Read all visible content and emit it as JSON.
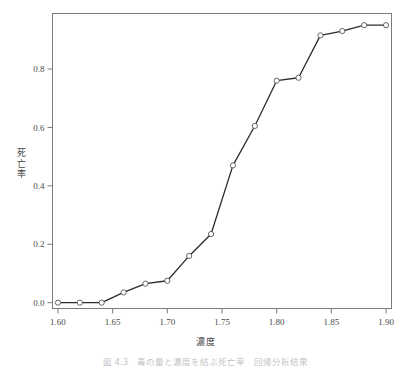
{
  "figure": {
    "caption": "図 4.3　毒の量と濃度を結ぶ死亡率　回帰分析結果",
    "xlabel": "濃度",
    "ylabel_chars": [
      "死",
      "亡",
      "率"
    ],
    "ylabel": "死亡率"
  },
  "chart_data": {
    "type": "line",
    "title": "",
    "subtitle": "",
    "xlabel": "濃度",
    "ylabel": "死亡率",
    "xlim": [
      1.595,
      1.905
    ],
    "ylim": [
      -0.02,
      0.99
    ],
    "xticks": [
      1.6,
      1.65,
      1.7,
      1.75,
      1.8,
      1.85,
      1.9
    ],
    "xticklabels": [
      "1.60",
      "1.65",
      "1.70",
      "1.75",
      "1.80",
      "1.85",
      "1.90"
    ],
    "yticks": [
      0.0,
      0.2,
      0.4,
      0.6,
      0.8
    ],
    "yticklabels": [
      "0.0",
      "0.2",
      "0.4",
      "0.6",
      "0.8"
    ],
    "grid": false,
    "legend": null,
    "marker": "circle-open",
    "line_color": "#2b2b2b",
    "marker_color": "#ffffff",
    "marker_edge_color": "#555555",
    "x": [
      1.6,
      1.62,
      1.64,
      1.66,
      1.68,
      1.7,
      1.72,
      1.74,
      1.76,
      1.78,
      1.8,
      1.82,
      1.84,
      1.86,
      1.88,
      1.9
    ],
    "y": [
      0.0,
      0.0,
      0.0,
      0.035,
      0.065,
      0.075,
      0.16,
      0.235,
      0.47,
      0.605,
      0.76,
      0.77,
      0.915,
      0.93,
      0.95,
      0.95
    ],
    "series": [
      {
        "name": "死亡率",
        "x": [
          1.6,
          1.62,
          1.64,
          1.66,
          1.68,
          1.7,
          1.72,
          1.74,
          1.76,
          1.78,
          1.8,
          1.82,
          1.84,
          1.86,
          1.88,
          1.9
        ],
        "values": [
          0.0,
          0.0,
          0.0,
          0.035,
          0.065,
          0.075,
          0.16,
          0.235,
          0.47,
          0.605,
          0.76,
          0.77,
          0.915,
          0.93,
          0.95,
          0.95
        ]
      }
    ]
  }
}
